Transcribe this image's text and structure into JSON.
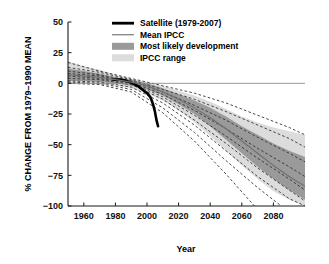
{
  "chart_data": {
    "type": "line",
    "title": "",
    "xlabel": "Year",
    "ylabel": "% CHANGE FROM 1979–1990 MEAN",
    "xlim": [
      1950,
      2100
    ],
    "ylim": [
      -100,
      50
    ],
    "xticks": [
      1960,
      1980,
      2000,
      2020,
      2040,
      2060,
      2080
    ],
    "xtick_labels": [
      "1960",
      "1980",
      "2000",
      "2020",
      "2040",
      "2060",
      "2080"
    ],
    "yticks": [
      50,
      25,
      0,
      -25,
      -50,
      -75,
      -100
    ],
    "ytick_labels": [
      "50",
      "25",
      "0",
      "−25",
      "−50",
      "−75",
      "−100"
    ],
    "grid": false,
    "zero_line": 0,
    "legend_position": "top-center",
    "legend": [
      {
        "label": "Satellite (1979-2007)",
        "marker": "thick-black-line",
        "color": "#000000"
      },
      {
        "label": "Mean IPCC",
        "marker": "thin-gray-line",
        "color": "#8a8a8a"
      },
      {
        "label": "Most likely development",
        "marker": "filled-swatch",
        "color": "#9a9a9a"
      },
      {
        "label": "IPCC range",
        "marker": "filled-swatch",
        "color": "#dcdcdc"
      }
    ],
    "series": [
      {
        "name": "Satellite (1979-2007)",
        "style": "thick-solid-black",
        "x": [
          1979,
          1983,
          1987,
          1991,
          1994,
          1996,
          1998,
          2000,
          2002,
          2003,
          2004,
          2005,
          2006,
          2007
        ],
        "values": [
          3,
          3,
          2,
          0,
          -2,
          -4,
          -6,
          -8,
          -11,
          -14,
          -18,
          -23,
          -30,
          -35
        ]
      },
      {
        "name": "Mean IPCC",
        "style": "thin-solid-gray",
        "x": [
          1950,
          1960,
          1970,
          1980,
          1990,
          2000,
          2010,
          2020,
          2030,
          2040,
          2050,
          2060,
          2070,
          2080,
          2090,
          2100
        ],
        "values": [
          7,
          6,
          5,
          3,
          1,
          -2,
          -7,
          -13,
          -20,
          -28,
          -37,
          -47,
          -57,
          -67,
          -76,
          -84
        ]
      }
    ],
    "bands": [
      {
        "name": "IPCC range",
        "fill": "#dcdcdc",
        "x": [
          1950,
          1960,
          1970,
          1980,
          1990,
          2000,
          2010,
          2020,
          2030,
          2040,
          2050,
          2060,
          2070,
          2080,
          2090,
          2100
        ],
        "upper": [
          18,
          14,
          11,
          7,
          4,
          1,
          -2,
          -6,
          -10,
          -15,
          -21,
          -27,
          -32,
          -36,
          -39,
          -42
        ],
        "lower": [
          0,
          0,
          -1,
          -2,
          -4,
          -8,
          -14,
          -22,
          -32,
          -43,
          -55,
          -67,
          -78,
          -88,
          -95,
          -100
        ]
      },
      {
        "name": "Most likely development",
        "fill": "#9a9a9a",
        "x": [
          1950,
          1960,
          1970,
          1980,
          1990,
          2000,
          2010,
          2020,
          2030,
          2040,
          2050,
          2060,
          2070,
          2080,
          2090,
          2100
        ],
        "upper": [
          12,
          10,
          8,
          5,
          3,
          0,
          -4,
          -9,
          -14,
          -20,
          -27,
          -35,
          -42,
          -49,
          -55,
          -60
        ],
        "lower": [
          2,
          2,
          1,
          0,
          -2,
          -5,
          -10,
          -17,
          -25,
          -35,
          -46,
          -57,
          -68,
          -78,
          -87,
          -95
        ]
      }
    ],
    "model_lines": [
      {
        "name": "model-1",
        "style": "dashed",
        "x": [
          1950,
          1970,
          1990,
          2010,
          2030,
          2050,
          2070,
          2090,
          2100
        ],
        "values": [
          17,
          10,
          4,
          -2,
          -8,
          -16,
          -26,
          -36,
          -42
        ]
      },
      {
        "name": "model-2",
        "style": "dashed",
        "x": [
          1950,
          1970,
          1990,
          2010,
          2030,
          2050,
          2070,
          2090,
          2100
        ],
        "values": [
          13,
          9,
          3,
          -5,
          -13,
          -23,
          -34,
          -45,
          -52
        ]
      },
      {
        "name": "model-3",
        "style": "dashed",
        "x": [
          1950,
          1970,
          1990,
          2010,
          2030,
          2050,
          2070,
          2090,
          2100
        ],
        "values": [
          10,
          7,
          2,
          -7,
          -18,
          -30,
          -44,
          -57,
          -64
        ]
      },
      {
        "name": "model-4",
        "style": "dashed",
        "x": [
          1950,
          1970,
          1990,
          2010,
          2030,
          2050,
          2070,
          2090,
          2100
        ],
        "values": [
          8,
          6,
          1,
          -9,
          -22,
          -37,
          -53,
          -68,
          -76
        ]
      },
      {
        "name": "model-5",
        "style": "dashed",
        "x": [
          1950,
          1970,
          1990,
          2010,
          2030,
          2050,
          2070,
          2090,
          2100
        ],
        "values": [
          6,
          4,
          0,
          -11,
          -26,
          -43,
          -61,
          -78,
          -87
        ]
      },
      {
        "name": "model-6",
        "style": "dashed",
        "x": [
          1950,
          1970,
          1990,
          2010,
          2030,
          2050,
          2070,
          2090,
          2100
        ],
        "values": [
          4,
          3,
          -1,
          -13,
          -30,
          -49,
          -69,
          -87,
          -96
        ]
      },
      {
        "name": "model-7",
        "style": "dashed",
        "x": [
          1950,
          1970,
          1990,
          2010,
          2030,
          2050,
          2070,
          2090,
          2100
        ],
        "values": [
          2,
          1,
          -3,
          -16,
          -34,
          -55,
          -76,
          -94,
          -100
        ]
      },
      {
        "name": "model-8",
        "style": "dashed",
        "x": [
          1950,
          1970,
          1990,
          2010,
          2030,
          2050,
          2070,
          2085
        ],
        "values": [
          1,
          0,
          -5,
          -20,
          -40,
          -63,
          -85,
          -100
        ]
      },
      {
        "name": "model-9",
        "style": "dashed",
        "x": [
          1950,
          1970,
          1990,
          2010,
          2030,
          2050,
          2068
        ],
        "values": [
          0,
          -1,
          -7,
          -24,
          -47,
          -74,
          -100
        ]
      }
    ]
  }
}
